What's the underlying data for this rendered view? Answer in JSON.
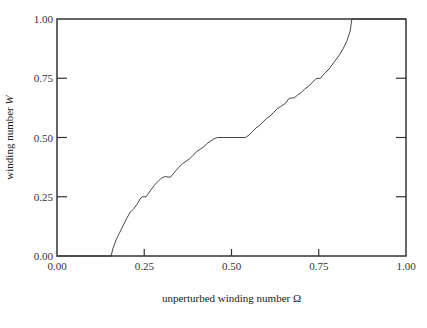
{
  "chart_data": {
    "type": "line",
    "title": "",
    "xlabel": "unperturbed winding number Ω",
    "ylabel_text": "winding number ",
    "ylabel_symbol": "W",
    "xlim": [
      0.0,
      1.0
    ],
    "ylim": [
      0.0,
      1.0
    ],
    "grid": false,
    "legend": null,
    "xticks": [
      "0.00",
      "0.25",
      "0.50",
      "0.75",
      "1.00"
    ],
    "yticks": [
      "0.00",
      "0.25",
      "0.50",
      "0.75",
      "1.00"
    ],
    "series": [
      {
        "name": "devil's staircase W(Ω)",
        "x": [
          0.0,
          0.155,
          0.16,
          0.17,
          0.18,
          0.19,
          0.2,
          0.21,
          0.22,
          0.23,
          0.24,
          0.245,
          0.255,
          0.26,
          0.27,
          0.28,
          0.29,
          0.3,
          0.31,
          0.32,
          0.325,
          0.335,
          0.34,
          0.35,
          0.36,
          0.37,
          0.38,
          0.39,
          0.4,
          0.41,
          0.42,
          0.43,
          0.44,
          0.45,
          0.46,
          0.54,
          0.55,
          0.56,
          0.57,
          0.58,
          0.59,
          0.6,
          0.61,
          0.62,
          0.63,
          0.64,
          0.655,
          0.665,
          0.675,
          0.68,
          0.69,
          0.7,
          0.71,
          0.72,
          0.73,
          0.74,
          0.745,
          0.755,
          0.76,
          0.77,
          0.78,
          0.79,
          0.8,
          0.81,
          0.82,
          0.83,
          0.84,
          0.845,
          1.0
        ],
        "y": [
          0.0,
          0.0,
          0.03,
          0.07,
          0.1,
          0.13,
          0.16,
          0.185,
          0.2,
          0.22,
          0.245,
          0.25,
          0.25,
          0.26,
          0.28,
          0.3,
          0.315,
          0.33,
          0.335,
          0.333,
          0.333,
          0.35,
          0.36,
          0.375,
          0.39,
          0.4,
          0.41,
          0.425,
          0.44,
          0.45,
          0.46,
          0.475,
          0.485,
          0.495,
          0.5,
          0.5,
          0.51,
          0.525,
          0.54,
          0.55,
          0.565,
          0.58,
          0.59,
          0.605,
          0.62,
          0.63,
          0.645,
          0.665,
          0.667,
          0.667,
          0.68,
          0.69,
          0.705,
          0.715,
          0.73,
          0.745,
          0.75,
          0.75,
          0.76,
          0.775,
          0.79,
          0.81,
          0.83,
          0.85,
          0.875,
          0.905,
          0.95,
          1.0,
          1.0
        ]
      }
    ],
    "annotations": []
  }
}
